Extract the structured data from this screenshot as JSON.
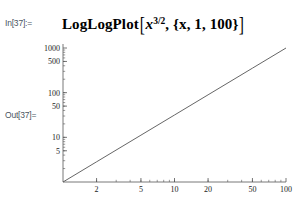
{
  "cell": {
    "in_label": "In[37]:=",
    "out_label": "Out[37]=",
    "input": {
      "head": "LogLogPlot",
      "open_bracket": "[",
      "variable": "x",
      "exponent": "3/2",
      "comma": ", ",
      "range": "{x, 1, 100}",
      "close_bracket": "]"
    }
  },
  "chart_data": {
    "type": "line",
    "title": "",
    "xlabel": "",
    "ylabel": "",
    "xscale": "log",
    "yscale": "log",
    "xlim": [
      1,
      100
    ],
    "ylim": [
      1,
      1000
    ],
    "grid": false,
    "legend": null,
    "function": "x^(3/2)",
    "xticks": [
      2,
      5,
      10,
      20,
      50,
      100
    ],
    "xtick_labels": [
      "2",
      "5",
      "10",
      "20",
      "50",
      "100"
    ],
    "yticks": [
      5,
      10,
      50,
      100,
      500,
      1000
    ],
    "ytick_labels": [
      "5",
      "10",
      "50",
      "100",
      "500",
      "1000"
    ],
    "series": [
      {
        "name": "x^(3/2)",
        "color": "#555555",
        "x": [
          1,
          2,
          5,
          10,
          20,
          50,
          100
        ],
        "y": [
          1,
          2.83,
          11.18,
          31.62,
          89.44,
          353.55,
          1000
        ]
      }
    ]
  },
  "colors": {
    "label": "#4a5561",
    "axis": "#555555",
    "curve": "#555555",
    "text": "#1a1a1a",
    "background": "#ffffff"
  }
}
